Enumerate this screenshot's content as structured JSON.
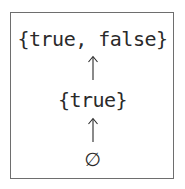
{
  "diagram": {
    "type": "lattice",
    "nodes": [
      {
        "id": "top",
        "label": "{true, false}"
      },
      {
        "id": "middle",
        "label": "{true}"
      },
      {
        "id": "bottom",
        "label": "∅"
      }
    ],
    "edges": [
      {
        "from": "bottom",
        "to": "middle",
        "symbol": "↑"
      },
      {
        "from": "middle",
        "to": "top",
        "symbol": "↑"
      }
    ],
    "colors": {
      "text": "#2a2a2a",
      "border": "#6e6e6e",
      "background": "#ffffff"
    }
  }
}
